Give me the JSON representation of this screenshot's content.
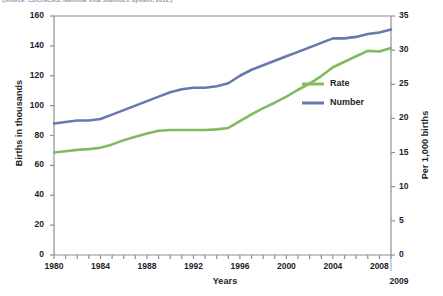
{
  "source_note": "(Source: CDC/NCHS, National Vital Statistics System, 2012.)",
  "chart_data": {
    "type": "line",
    "title": "",
    "xlabel": "Years",
    "ylabel": "Births in thousands",
    "ylabel_right": "Per 1,000 births",
    "grid": false,
    "legend_position": "inside-right",
    "x": [
      1980,
      1981,
      1982,
      1983,
      1984,
      1985,
      1986,
      1987,
      1988,
      1989,
      1990,
      1991,
      1992,
      1993,
      1994,
      1995,
      1996,
      1997,
      1998,
      1999,
      2000,
      2001,
      2002,
      2003,
      2004,
      2005,
      2006,
      2007,
      2008,
      2009
    ],
    "xlim": [
      1980,
      2009
    ],
    "xticks": [
      1980,
      1984,
      1988,
      1992,
      1996,
      2000,
      2004,
      2008
    ],
    "xtick_labels": [
      "1980",
      "1984",
      "1988",
      "1992",
      "1996",
      "2000",
      "2004",
      "2008"
    ],
    "x_end_label": "2009",
    "ylim": [
      0,
      160
    ],
    "yticks": [
      0,
      20,
      40,
      60,
      80,
      100,
      120,
      140,
      160
    ],
    "ytick_labels": [
      "0",
      "20",
      "40",
      "60",
      "80",
      "100",
      "120",
      "140",
      "160"
    ],
    "ylim_right": [
      0,
      35
    ],
    "yticks_right": [
      0,
      5,
      10,
      15,
      20,
      25,
      30,
      35
    ],
    "ytick_labels_right": [
      "0",
      "5",
      "10",
      "15",
      "20",
      "25",
      "30",
      "35"
    ],
    "series": [
      {
        "name": "Number",
        "label": "Number",
        "axis": "left",
        "color": "#6779ad",
        "units": "Births in thousands",
        "values": [
          88,
          89,
          90,
          90,
          91,
          94,
          97,
          100,
          103,
          106,
          109,
          111,
          112,
          112,
          113,
          115,
          120,
          124,
          127,
          130,
          133,
          136,
          139,
          142,
          145,
          145,
          146,
          148,
          149,
          151
        ]
      },
      {
        "name": "Rate",
        "label": "Rate",
        "axis": "right",
        "color": "#81bb60",
        "units": "Per 1,000 births",
        "values": [
          15.0,
          15.2,
          15.4,
          15.5,
          15.7,
          16.2,
          16.8,
          17.3,
          17.8,
          18.2,
          18.3,
          18.3,
          18.3,
          18.3,
          18.4,
          18.6,
          19.6,
          20.6,
          21.5,
          22.3,
          23.2,
          24.2,
          25.1,
          26.2,
          27.5,
          28.3,
          29.1,
          29.9,
          29.8,
          30.3
        ]
      }
    ]
  }
}
